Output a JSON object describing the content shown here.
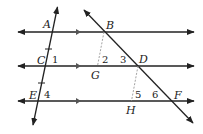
{
  "diagram": {
    "points": {
      "A": "A",
      "B": "B",
      "C": "C",
      "D": "D",
      "E": "E",
      "F": "F",
      "G": "G",
      "H": "H"
    },
    "angles": {
      "a1": "1",
      "a2": "2",
      "a3": "3",
      "a4": "4",
      "a5": "5",
      "a6": "6"
    },
    "colors": {
      "line": "#222222",
      "dashed": "#999999",
      "background": "#ffffff"
    }
  }
}
